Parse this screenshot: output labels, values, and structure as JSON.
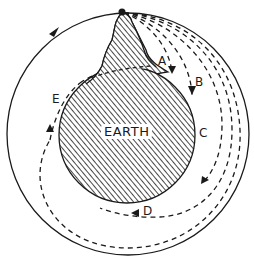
{
  "diagram": {
    "colors": {
      "ink": "#1a1a1a",
      "background": "#ffffff"
    },
    "earth": {
      "label": "EARTH",
      "cx": 127,
      "cy": 135,
      "r": 68
    },
    "mountain": {
      "peak": [
        122,
        12
      ]
    },
    "cannon": {
      "position": [
        122,
        12
      ]
    },
    "orbit": {
      "type": "circular",
      "cx": 128,
      "cy": 134,
      "r": 121,
      "style": "solid",
      "direction": "clockwise"
    },
    "trajectories": [
      {
        "id": "A",
        "label": "A",
        "style": "dashed",
        "outcome": "falls to earth"
      },
      {
        "id": "B",
        "label": "B",
        "style": "dashed",
        "outcome": "falls to earth"
      },
      {
        "id": "C",
        "label": "C",
        "style": "dashed",
        "outcome": "falls to earth"
      },
      {
        "id": "D",
        "label": "D",
        "style": "dashed",
        "outcome": "falls to earth"
      },
      {
        "id": "E",
        "label": "E",
        "style": "dashed",
        "outcome": "circles earth back to mountain"
      }
    ]
  }
}
